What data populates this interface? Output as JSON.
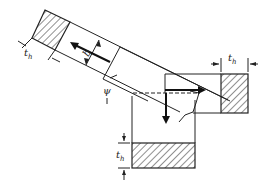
{
  "diagram": {
    "labels": {
      "chip_thickness_left": "t",
      "chip_thickness_left_sub": "h",
      "chip_thickness_right": "t",
      "chip_thickness_right_sub": "h",
      "chip_thickness_bottom": "t",
      "chip_thickness_bottom_sub": "h",
      "width": "b",
      "angle": "ψ"
    },
    "colors": {
      "line": "#222222",
      "background": "#ffffff"
    }
  }
}
